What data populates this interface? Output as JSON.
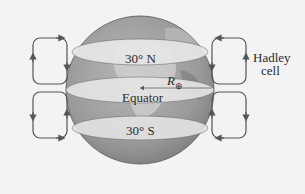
{
  "diagram": {
    "labels": {
      "north": "30° N",
      "south": "30° S",
      "equator": "Equator",
      "radius_symbol": "R",
      "radius_subscript": "⊕",
      "hadley_line1": "Hadley",
      "hadley_line2": "cell"
    },
    "colors": {
      "background": "#f3f3f3",
      "globe_dark": "#8a8a8a",
      "globe_mid": "#a8a8a8",
      "band_light": "#e6e6e6",
      "cell_stroke": "#555555"
    }
  }
}
